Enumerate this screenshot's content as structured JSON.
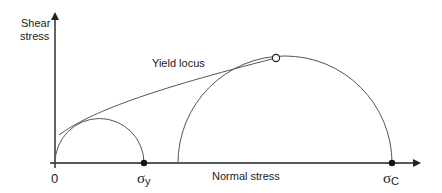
{
  "diagram": {
    "type": "mohr-circle",
    "y_axis_label_line1": "Shear",
    "y_axis_label_line2": "stress",
    "x_axis_label": "Normal stress",
    "origin_label": "0",
    "yield_locus_label": "Yield locus",
    "sigma_y": {
      "symbol": "σ",
      "subscript": "y"
    },
    "sigma_c": {
      "symbol": "σ",
      "subscript": "C"
    },
    "colors": {
      "line": "#555555",
      "axis": "#222222",
      "point": "#111111"
    }
  }
}
